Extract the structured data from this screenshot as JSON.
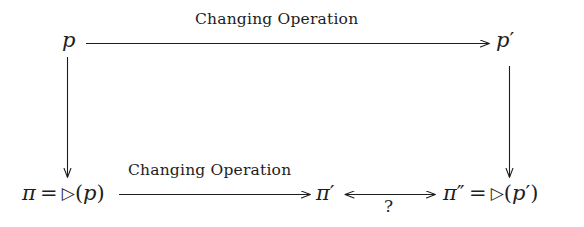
{
  "diagram": {
    "type": "commutative-diagram",
    "background_color": "#ffffff",
    "stroke_color": "#1d1d1d",
    "nodes": [
      {
        "id": "p",
        "label": "p",
        "position": "top-left"
      },
      {
        "id": "p_prime",
        "label": "p′",
        "position": "top-right"
      },
      {
        "id": "pi_def",
        "label": "π = ▷(p)",
        "position": "bottom-left"
      },
      {
        "id": "pi_prime",
        "label": "π′",
        "position": "bottom-center"
      },
      {
        "id": "pi_dprime_def",
        "label": "π″ = ▷(p′)",
        "position": "bottom-right"
      }
    ],
    "edges": [
      {
        "id": "top-edge",
        "from": "p",
        "to": "p_prime",
        "label": "Changing Operation",
        "arrow": "single",
        "direction": "right"
      },
      {
        "id": "left-edge",
        "from": "p",
        "to": "pi_def",
        "label": "",
        "arrow": "single",
        "direction": "down"
      },
      {
        "id": "right-edge",
        "from": "p_prime",
        "to": "pi_dprime_def",
        "label": "",
        "arrow": "single",
        "direction": "down"
      },
      {
        "id": "bottom-edge",
        "from": "pi_def",
        "to": "pi_prime",
        "label": "Changing Operation",
        "arrow": "single",
        "direction": "right"
      },
      {
        "id": "question-edge",
        "from": "pi_prime",
        "to": "pi_dprime_def",
        "label": "?",
        "arrow": "double",
        "direction": "both"
      }
    ],
    "text": {
      "top_label": "Changing Operation",
      "bottom_label": "Changing Operation",
      "question_label": "?",
      "node_p": "p",
      "node_p_prime_base": "p",
      "node_p_prime_mark": "′",
      "pi_symbol": "π",
      "equals": "=",
      "operator": "▷",
      "open_paren": "(",
      "close_paren": ")",
      "prime_single": "′",
      "prime_double": "″",
      "arg_p": "p"
    }
  }
}
